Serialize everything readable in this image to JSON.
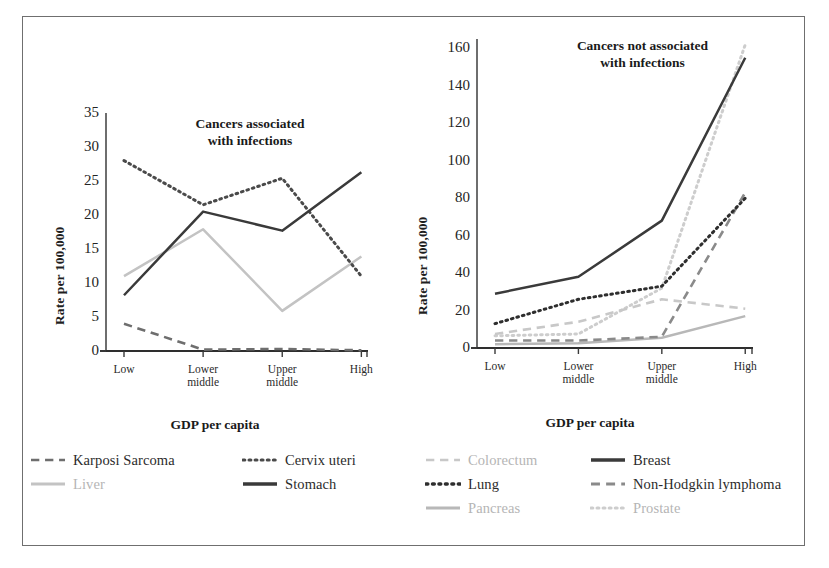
{
  "figure": {
    "background": "#ffffff",
    "border_color": "#6f6f6f"
  },
  "axis_common": {
    "ylabel": "Rate per 100,000",
    "xlabel": "GDP per capita",
    "categories": [
      "Low",
      "Lower\nmiddle",
      "Upper\nmiddle",
      "High"
    ]
  },
  "left": {
    "title": "Cancers associated\nwith infections",
    "yticks": [
      "0",
      "5",
      "10",
      "15",
      "20",
      "25",
      "30",
      "35"
    ],
    "ylabel": "Rate per 100,000",
    "xlabel": "GDP per capita"
  },
  "right": {
    "title": "Cancers not associated\nwith infections",
    "yticks": [
      "0",
      "20",
      "40",
      "60",
      "80",
      "100",
      "120",
      "140",
      "160"
    ],
    "ylabel": "Rate per 100,000",
    "xlabel": "GDP per capita"
  },
  "legend": {
    "columns": [
      {
        "left": 0,
        "width": 195,
        "items": [
          {
            "label": "Karposi Sarcoma",
            "style": "dashed",
            "color": "#6e6e6e",
            "width": 2.6
          },
          {
            "label": "Liver",
            "style": "solid",
            "color": "#c3c3c3",
            "width": 3.0
          }
        ]
      },
      {
        "left": 212,
        "width": 175,
        "items": [
          {
            "label": "Cervix uteri",
            "style": "dotted",
            "color": "#4a4a4a",
            "width": 3.2
          },
          {
            "label": "Stomach",
            "style": "solid",
            "color": "#3a3a3a",
            "width": 3.4
          }
        ]
      },
      {
        "left": 395,
        "width": 160,
        "items": [
          {
            "label": "Colorectum",
            "style": "dashed",
            "color": "#c8c8c8",
            "width": 2.6
          },
          {
            "label": "Lung",
            "style": "dotted",
            "color": "#2e2e2e",
            "width": 3.4
          },
          {
            "label": "Pancreas",
            "style": "solid",
            "color": "#b8b8b8",
            "width": 3.0
          }
        ]
      },
      {
        "left": 560,
        "width": 215,
        "items": [
          {
            "label": "Breast",
            "style": "solid",
            "color": "#3a3a3a",
            "width": 3.4
          },
          {
            "label": "Non-Hodgkin lymphoma",
            "style": "dashed",
            "color": "#8a8a8a",
            "width": 2.8
          },
          {
            "label": "Prostate",
            "style": "dotted",
            "color": "#cdcdcd",
            "width": 3.2
          }
        ]
      }
    ]
  },
  "chart_data": [
    {
      "id": "left",
      "type": "line",
      "title": "Cancers associated with infections",
      "xlabel": "GDP per capita",
      "ylabel": "Rate per 100,000",
      "categories": [
        "Low",
        "Lower middle",
        "Upper middle",
        "High"
      ],
      "ylim": [
        0,
        35
      ],
      "ytick_step": 5,
      "grid": false,
      "legend_position": "bottom",
      "series": [
        {
          "name": "Cervix uteri",
          "values": [
            28.0,
            21.5,
            25.4,
            11.0
          ],
          "style": "dotted",
          "color": "#4a4a4a"
        },
        {
          "name": "Stomach",
          "values": [
            8.2,
            20.5,
            17.7,
            26.3
          ],
          "style": "solid",
          "color": "#3a3a3a"
        },
        {
          "name": "Liver",
          "values": [
            11.0,
            17.9,
            5.9,
            13.9
          ],
          "style": "solid",
          "color": "#c3c3c3"
        },
        {
          "name": "Karposi Sarcoma",
          "values": [
            4.0,
            0.2,
            0.3,
            0.1
          ],
          "style": "dashed",
          "color": "#6e6e6e"
        }
      ]
    },
    {
      "id": "right",
      "type": "line",
      "title": "Cancers not associated with infections",
      "xlabel": "GDP per capita",
      "ylabel": "Rate per 100,000",
      "categories": [
        "Low",
        "Lower middle",
        "Upper middle",
        "High"
      ],
      "ylim": [
        0,
        165
      ],
      "ytick_step": 20,
      "grid": false,
      "legend_position": "bottom",
      "series": [
        {
          "name": "Breast",
          "values": [
            29.0,
            38.0,
            68.0,
            155.0
          ],
          "style": "solid",
          "color": "#3a3a3a"
        },
        {
          "name": "Prostate",
          "values": [
            6.5,
            7.5,
            32.0,
            162.0
          ],
          "style": "dotted",
          "color": "#cdcdcd"
        },
        {
          "name": "Lung",
          "values": [
            13.0,
            26.0,
            33.0,
            80.0
          ],
          "style": "dotted",
          "color": "#2e2e2e"
        },
        {
          "name": "Colorectum",
          "values": [
            7.5,
            14.0,
            26.0,
            21.0
          ],
          "style": "dashed",
          "color": "#c8c8c8"
        },
        {
          "name": "Non-Hodgkin lymphoma",
          "values": [
            4.0,
            4.0,
            6.0,
            83.0
          ],
          "style": "dashed",
          "color": "#8a8a8a"
        },
        {
          "name": "Pancreas",
          "values": [
            2.0,
            2.5,
            5.5,
            17.0
          ],
          "style": "solid",
          "color": "#b8b8b8"
        }
      ]
    }
  ]
}
